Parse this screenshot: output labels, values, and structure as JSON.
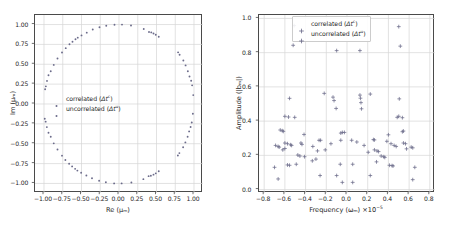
{
  "figure": {
    "background": "#ffffff",
    "marker_color": "#6b6b8a",
    "grid_color": "#d6d6d6",
    "axis_color": "#4a4a4a"
  },
  "chart_data": [
    {
      "type": "scatter",
      "panel": "left",
      "title": "",
      "xlabel": "Re (μₘ)",
      "ylabel": "Im (μₘ)",
      "xlim": [
        -1.12,
        1.12
      ],
      "ylim": [
        -1.12,
        1.12
      ],
      "xticks": [
        -1.0,
        -0.75,
        -0.5,
        -0.25,
        0.0,
        0.25,
        0.5,
        0.75,
        1.0
      ],
      "xticklabels": [
        "-1.00",
        "-0.75",
        "-0.50",
        "-0.25",
        "0.00",
        "0.25",
        "0.50",
        "0.75",
        "1.00"
      ],
      "yticks": [
        -1.0,
        -0.75,
        -0.5,
        -0.25,
        0.0,
        0.25,
        0.5,
        0.75,
        1.0
      ],
      "yticklabels": [
        "-1.00",
        "-0.75",
        "-0.50",
        "-0.25",
        "0.00",
        "0.25",
        "0.50",
        "0.75",
        "1.00"
      ],
      "grid": true,
      "legend_position": "center-left",
      "legend_framed": false,
      "marker": "dot",
      "series": [
        {
          "name": "correlated (Δtᶜ)",
          "label_html": "correlated (<i>Δt</i><sup>c</sup>)",
          "points": [
            [
              -0.06,
              0.998
            ],
            [
              0.04,
              0.999
            ],
            [
              0.16,
              0.987
            ],
            [
              -0.17,
              0.985
            ],
            [
              -0.26,
              0.966
            ],
            [
              -0.35,
              0.937
            ],
            [
              0.33,
              0.944
            ],
            [
              0.4,
              0.906
            ],
            [
              0.43,
              0.901
            ],
            [
              0.46,
              0.888
            ],
            [
              0.49,
              0.872
            ],
            [
              0.53,
              0.846
            ],
            [
              -0.43,
              0.898
            ],
            [
              -0.5,
              0.863
            ],
            [
              -0.55,
              0.835
            ],
            [
              -0.58,
              0.814
            ],
            [
              -0.62,
              0.784
            ],
            [
              -0.66,
              0.751
            ],
            [
              -0.71,
              0.703
            ],
            [
              -0.76,
              0.648
            ],
            [
              -0.82,
              0.572
            ],
            [
              -0.87,
              0.492
            ],
            [
              -0.91,
              0.412
            ],
            [
              -0.94,
              0.361
            ],
            [
              -0.96,
              0.291
            ],
            [
              -0.975,
              0.222
            ],
            [
              -0.985,
              0.185
            ],
            [
              -0.99,
              -0.185
            ],
            [
              -0.978,
              -0.222
            ],
            [
              -0.962,
              -0.291
            ],
            [
              -0.94,
              -0.362
            ],
            [
              -0.91,
              -0.412
            ],
            [
              -0.87,
              -0.495
            ],
            [
              -0.82,
              -0.573
            ],
            [
              -0.76,
              -0.65
            ],
            [
              -0.715,
              -0.705
            ],
            [
              -0.665,
              -0.752
            ],
            [
              -0.625,
              -0.785
            ],
            [
              -0.585,
              -0.816
            ],
            [
              -0.555,
              -0.838
            ],
            [
              -0.505,
              -0.866
            ],
            [
              -0.435,
              -0.9
            ],
            [
              -0.36,
              -0.935
            ],
            [
              -0.265,
              -0.965
            ],
            [
              -0.175,
              -0.985
            ],
            [
              -0.065,
              -0.999
            ],
            [
              0.035,
              -0.999
            ],
            [
              0.165,
              -0.987
            ],
            [
              0.325,
              -0.946
            ],
            [
              0.395,
              -0.908
            ],
            [
              0.425,
              -0.902
            ],
            [
              0.46,
              -0.889
            ],
            [
              0.49,
              -0.873
            ],
            [
              0.53,
              -0.847
            ],
            [
              0.785,
              -0.648
            ],
            [
              0.805,
              -0.618
            ],
            [
              0.855,
              -0.545
            ],
            [
              0.885,
              -0.483
            ],
            [
              0.915,
              -0.412
            ],
            [
              0.935,
              -0.345
            ],
            [
              0.955,
              -0.29
            ],
            [
              0.97,
              -0.232
            ],
            [
              0.985,
              -0.122
            ],
            [
              0.99,
              0.112
            ],
            [
              0.975,
              0.235
            ],
            [
              0.962,
              0.292
            ],
            [
              0.94,
              0.346
            ],
            [
              0.918,
              0.412
            ],
            [
              0.888,
              0.486
            ],
            [
              0.858,
              0.548
            ],
            [
              0.808,
              0.62
            ],
            [
              0.788,
              0.65
            ]
          ]
        },
        {
          "name": "uncorrelated (Δtᵘ)",
          "label_html": "uncorrelated (<i>Δt</i><sup>u</sup>)",
          "points": []
        }
      ]
    },
    {
      "type": "scatter",
      "panel": "right",
      "title": "",
      "xlabel": "Frequency (ωₘ) ×10⁻⁵",
      "ylabel": "Amplitude (|bₘ|)",
      "xlim": [
        -0.85,
        0.85
      ],
      "ylim": [
        -0.02,
        1.02
      ],
      "xticks": [
        -0.8,
        -0.6,
        -0.4,
        -0.2,
        0.0,
        0.2,
        0.4,
        0.6,
        0.8
      ],
      "xticklabels": [
        "-0.8",
        "-0.6",
        "-0.4",
        "-0.2",
        "0.0",
        "0.2",
        "0.4",
        "0.6",
        "0.8"
      ],
      "yticks": [
        0.0,
        0.2,
        0.4,
        0.6,
        0.8,
        1.0
      ],
      "yticklabels": [
        "0.0",
        "0.2",
        "0.4",
        "0.6",
        "0.8",
        "1.0"
      ],
      "grid": true,
      "legend_position": "upper-center",
      "legend_framed": true,
      "marker": "plus",
      "series": [
        {
          "name": "correlated (Δtᶜ)",
          "label_html": "correlated (<i>Δt</i><sup>c</sup>)",
          "points": [
            [
              -0.51,
              0.958
            ],
            [
              0.5,
              0.952
            ],
            [
              -0.52,
              0.843
            ],
            [
              0.515,
              0.838
            ],
            [
              -0.1,
              0.812
            ],
            [
              0.125,
              0.812
            ],
            [
              -0.555,
              0.533
            ],
            [
              0.505,
              0.53
            ],
            [
              -0.22,
              0.562
            ],
            [
              0.225,
              0.558
            ],
            [
              -0.135,
              0.54
            ],
            [
              -0.125,
              0.52
            ],
            [
              0.125,
              0.552
            ],
            [
              0.13,
              0.534
            ],
            [
              0.135,
              0.508
            ],
            [
              -0.105,
              0.474
            ],
            [
              0.14,
              0.472
            ],
            [
              -0.6,
              0.428
            ],
            [
              -0.565,
              0.424
            ],
            [
              -0.505,
              0.422
            ],
            [
              0.485,
              0.422
            ],
            [
              0.535,
              0.42
            ],
            [
              0.5,
              0.428
            ],
            [
              -0.645,
              0.348
            ],
            [
              -0.625,
              0.344
            ],
            [
              -0.615,
              0.34
            ],
            [
              -0.415,
              0.322
            ],
            [
              0.4,
              0.32
            ],
            [
              0.545,
              0.342
            ],
            [
              0.535,
              0.338
            ],
            [
              -0.045,
              0.334
            ],
            [
              -0.025,
              0.334
            ],
            [
              -0.06,
              0.33
            ],
            [
              0.045,
              0.288
            ],
            [
              0.255,
              0.292
            ],
            [
              0.265,
              0.29
            ],
            [
              -0.27,
              0.288
            ],
            [
              -0.255,
              0.288
            ],
            [
              -0.665,
              0.252
            ],
            [
              -0.655,
              0.248
            ],
            [
              -0.69,
              0.258
            ],
            [
              -0.6,
              0.272
            ],
            [
              -0.575,
              0.268
            ],
            [
              -0.545,
              0.262
            ],
            [
              -0.535,
              0.258
            ],
            [
              -0.445,
              0.272
            ],
            [
              -0.435,
              0.264
            ],
            [
              -0.33,
              0.252
            ],
            [
              -0.285,
              0.226
            ],
            [
              -0.21,
              0.232
            ],
            [
              -0.155,
              0.268
            ],
            [
              -0.06,
              0.288
            ],
            [
              0.095,
              0.278
            ],
            [
              0.165,
              0.258
            ],
            [
              0.205,
              0.218
            ],
            [
              0.265,
              0.232
            ],
            [
              0.29,
              0.226
            ],
            [
              0.305,
              0.222
            ],
            [
              0.385,
              0.282
            ],
            [
              0.425,
              0.268
            ],
            [
              0.455,
              0.258
            ],
            [
              0.475,
              0.252
            ],
            [
              0.545,
              0.272
            ],
            [
              0.565,
              0.268
            ],
            [
              0.575,
              0.238
            ],
            [
              0.62,
              0.248
            ],
            [
              0.635,
              0.244
            ],
            [
              -0.62,
              0.232
            ],
            [
              -0.6,
              0.24
            ],
            [
              -0.475,
              0.202
            ],
            [
              -0.455,
              0.196
            ],
            [
              -0.41,
              0.192
            ],
            [
              -0.335,
              0.168
            ],
            [
              -0.3,
              0.178
            ],
            [
              0.33,
              0.196
            ],
            [
              0.355,
              0.192
            ],
            [
              0.365,
              0.188
            ],
            [
              0.285,
              0.162
            ],
            [
              -0.7,
              0.13
            ],
            [
              -0.665,
              0.062
            ],
            [
              -0.575,
              0.144
            ],
            [
              -0.555,
              0.142
            ],
            [
              -0.49,
              0.148
            ],
            [
              -0.065,
              0.148
            ],
            [
              0.055,
              0.148
            ],
            [
              0.41,
              0.142
            ],
            [
              0.435,
              0.14
            ],
            [
              0.445,
              0.138
            ],
            [
              0.655,
              0.13
            ],
            [
              0.635,
              0.058
            ],
            [
              -0.26,
              0.082
            ],
            [
              -0.1,
              0.082
            ],
            [
              0.055,
              0.042
            ],
            [
              -0.045,
              0.042
            ],
            [
              0.225,
              0.082
            ]
          ]
        },
        {
          "name": "uncorrelated (Δtᵘ)",
          "label_html": "uncorrelated (<i>Δt</i><sup>u</sup>)",
          "points": []
        }
      ]
    }
  ]
}
